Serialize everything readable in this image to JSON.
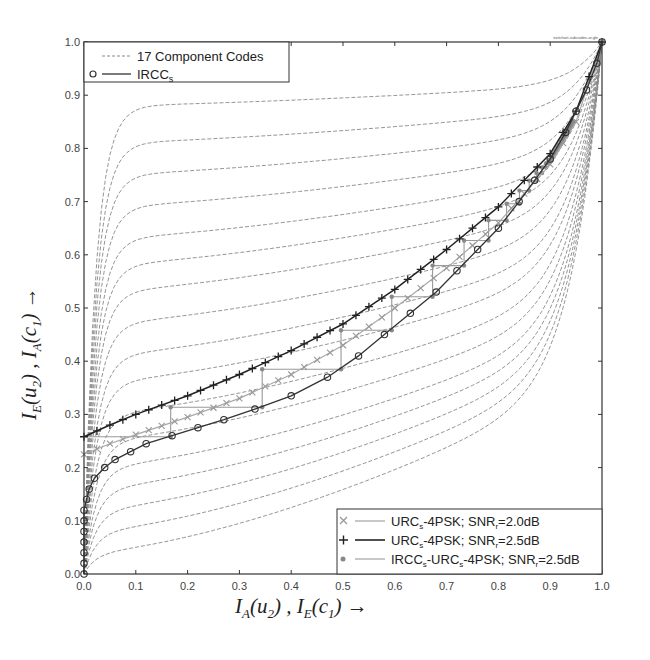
{
  "chart_data": {
    "type": "line",
    "title": "",
    "corner_note": "exitchart-subcodes-ar.gle",
    "xlabel": "I_A(u_2) , I_E(c_1)  →",
    "ylabel": "I_E(u_2) , I_A(c_1)  →",
    "xlim": [
      0.0,
      1.0
    ],
    "ylim": [
      0.0,
      1.0
    ],
    "xticks": [
      "0.0",
      "0.1",
      "0.2",
      "0.3",
      "0.4",
      "0.5",
      "0.6",
      "0.7",
      "0.8",
      "0.9",
      "1.0"
    ],
    "yticks": [
      "0.0",
      "0.1",
      "0.2",
      "0.3",
      "0.4",
      "0.5",
      "0.6",
      "0.7",
      "0.8",
      "0.9",
      "1.0"
    ],
    "grid": false,
    "legend_top": {
      "position": "upper-left",
      "entries": [
        {
          "label": "17 Component Codes",
          "style": "dashed",
          "marker": "none"
        },
        {
          "label": "IRCC",
          "subscript": "s",
          "style": "solid",
          "marker": "circle"
        }
      ]
    },
    "legend_bottom": {
      "position": "lower-right",
      "entries": [
        {
          "label": "URC",
          "sub": "s",
          "rest": "-4PSK; SNR",
          "sub2": "r",
          "tail": "=2.0dB",
          "marker": "x",
          "style": "solid-light"
        },
        {
          "label": "URC",
          "sub": "s",
          "rest": "-4PSK; SNR",
          "sub2": "r",
          "tail": "=2.5dB",
          "marker": "plus",
          "style": "solid-dark"
        },
        {
          "label": "IRCC",
          "sub": "s",
          "rest": "-URC",
          "sub2": "s",
          "tail": "-4PSK; SNR",
          "sub3": "r",
          "tail2": "=2.5dB",
          "marker": "dot",
          "style": "solid-light"
        }
      ]
    },
    "series": [
      {
        "name": "17 Component Codes",
        "style": "dashed",
        "count": 17,
        "description": "Family of EXIT curves from (0, y0) to (1,1) with y0 from 0 to ~0.92 rising steeply at x=0 then flattening, and some starting at (0,0) and bending up near x=1",
        "start_y_values": [
          0.0,
          0.0,
          0.0,
          0.0,
          0.0,
          0.0,
          0.0,
          0.0,
          0.0,
          0.0,
          0.0,
          0.0,
          0.0,
          0.0,
          0.0,
          0.0,
          0.0
        ],
        "plateau_at_x0_05": [
          0.04,
          0.08,
          0.12,
          0.16,
          0.2,
          0.25,
          0.3,
          0.36,
          0.41,
          0.47,
          0.53,
          0.58,
          0.63,
          0.69,
          0.75,
          0.81,
          0.88
        ]
      },
      {
        "name": "IRCCs",
        "marker": "circle",
        "x": [
          0.0,
          0.0,
          0.0,
          0.0,
          0.0,
          0.0,
          0.0,
          0.005,
          0.01,
          0.02,
          0.04,
          0.06,
          0.09,
          0.12,
          0.17,
          0.22,
          0.27,
          0.33,
          0.4,
          0.47,
          0.53,
          0.58,
          0.63,
          0.68,
          0.72,
          0.76,
          0.8,
          0.84,
          0.87,
          0.9,
          0.93,
          0.95,
          0.97,
          0.99,
          1.0
        ],
        "y": [
          0.0,
          0.02,
          0.04,
          0.06,
          0.08,
          0.1,
          0.12,
          0.14,
          0.16,
          0.18,
          0.2,
          0.215,
          0.23,
          0.245,
          0.26,
          0.275,
          0.29,
          0.31,
          0.335,
          0.37,
          0.41,
          0.45,
          0.49,
          0.53,
          0.57,
          0.61,
          0.65,
          0.7,
          0.74,
          0.78,
          0.83,
          0.87,
          0.91,
          0.96,
          1.0
        ]
      },
      {
        "name": "URCs-4PSK; SNRr=2.0dB",
        "marker": "x",
        "x": [
          0.0,
          0.05,
          0.1,
          0.2,
          0.3,
          0.4,
          0.5,
          0.6,
          0.7,
          0.8,
          0.9,
          0.95,
          1.0
        ],
        "y": [
          0.225,
          0.245,
          0.262,
          0.295,
          0.33,
          0.375,
          0.43,
          0.5,
          0.575,
          0.66,
          0.77,
          0.85,
          1.0
        ]
      },
      {
        "name": "URCs-4PSK; SNRr=2.5dB",
        "marker": "plus",
        "x": [
          0.0,
          0.05,
          0.1,
          0.2,
          0.3,
          0.4,
          0.5,
          0.6,
          0.7,
          0.8,
          0.9,
          0.95,
          1.0
        ],
        "y": [
          0.258,
          0.28,
          0.3,
          0.335,
          0.375,
          0.42,
          0.47,
          0.535,
          0.61,
          0.69,
          0.79,
          0.87,
          1.0
        ]
      },
      {
        "name": "IRCCs-URCs-4PSK; SNRr=2.5dB",
        "marker": "dot",
        "description": "Decoding trajectory staircase between the IRCCs curve and the URCs 2.5dB curve, from (0,0.258) to (1,1)"
      }
    ]
  }
}
